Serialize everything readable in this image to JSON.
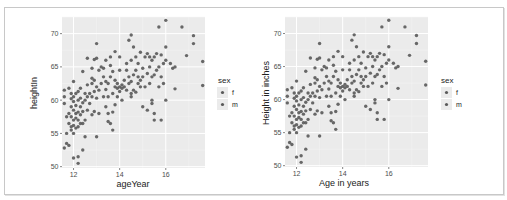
{
  "chart_data": [
    {
      "type": "scatter",
      "title": "",
      "xlabel": "ageYear",
      "ylabel": "heightIn",
      "xlim": [
        11.5,
        17.7
      ],
      "ylim": [
        49.8,
        72.5
      ],
      "x_ticks": [
        12,
        14,
        16
      ],
      "y_ticks": [
        50,
        55,
        60,
        65,
        70
      ],
      "grid": true,
      "legend": {
        "title": "sex",
        "entries": [
          "f",
          "m"
        ],
        "position": "right"
      }
    },
    {
      "type": "scatter",
      "title": "",
      "xlabel": "Age in years",
      "ylabel": "Height in inches",
      "xlim": [
        11.5,
        17.7
      ],
      "ylim": [
        49.8,
        72.5
      ],
      "x_ticks": [
        12,
        14,
        16
      ],
      "y_ticks": [
        50,
        55,
        60,
        65,
        70
      ],
      "grid": true,
      "legend": {
        "title": "sex",
        "entries": [
          "f",
          "m"
        ],
        "position": "right"
      }
    }
  ],
  "points": [
    [
      11.6,
      52.8
    ],
    [
      11.7,
      55
    ],
    [
      11.7,
      57.5
    ],
    [
      11.6,
      59.5
    ],
    [
      11.6,
      60.5
    ],
    [
      11.6,
      61.5
    ],
    [
      11.7,
      53.5
    ],
    [
      11.8,
      53.2
    ],
    [
      11.8,
      56.5
    ],
    [
      11.8,
      58
    ],
    [
      11.8,
      61.8
    ],
    [
      11.9,
      55.5
    ],
    [
      11.9,
      56
    ],
    [
      11.9,
      57.5
    ],
    [
      11.9,
      59
    ],
    [
      11.9,
      60.2
    ],
    [
      11.9,
      61
    ],
    [
      12,
      51.3
    ],
    [
      12,
      55
    ],
    [
      12,
      56.2
    ],
    [
      12,
      57
    ],
    [
      12,
      58.5
    ],
    [
      12,
      59.8
    ],
    [
      12,
      60.5
    ],
    [
      12,
      62.8
    ],
    [
      12.1,
      55.8
    ],
    [
      12.1,
      57.3
    ],
    [
      12.1,
      58
    ],
    [
      12.1,
      59.2
    ],
    [
      12.1,
      61
    ],
    [
      12.2,
      50.5
    ],
    [
      12.2,
      51.5
    ],
    [
      12.2,
      56
    ],
    [
      12.2,
      57
    ],
    [
      12.2,
      58.2
    ],
    [
      12.2,
      60
    ],
    [
      12.2,
      61.3
    ],
    [
      12.3,
      56.5
    ],
    [
      12.3,
      57.8
    ],
    [
      12.3,
      59
    ],
    [
      12.3,
      60.3
    ],
    [
      12.3,
      61.8
    ],
    [
      12.4,
      52.5
    ],
    [
      12.4,
      56.5
    ],
    [
      12.4,
      58.3
    ],
    [
      12.4,
      59.6
    ],
    [
      12.4,
      64.3
    ],
    [
      12.5,
      54.5
    ],
    [
      12.5,
      57
    ],
    [
      12.5,
      60
    ],
    [
      12.5,
      61
    ],
    [
      12.6,
      58.5
    ],
    [
      12.6,
      60.5
    ],
    [
      12.6,
      62.3
    ],
    [
      12.6,
      66.3
    ],
    [
      12.7,
      59.5
    ],
    [
      12.7,
      61
    ],
    [
      12.8,
      57.8
    ],
    [
      12.8,
      60.5
    ],
    [
      12.8,
      62.5
    ],
    [
      12.8,
      63.3
    ],
    [
      12.8,
      64.8
    ],
    [
      12.9,
      58.3
    ],
    [
      12.9,
      61.3
    ],
    [
      12.9,
      63
    ],
    [
      12.9,
      66.1
    ],
    [
      13,
      54.5
    ],
    [
      13,
      60.3
    ],
    [
      13,
      62
    ],
    [
      13,
      66.3
    ],
    [
      13,
      68.5
    ],
    [
      13.1,
      58
    ],
    [
      13.1,
      61.5
    ],
    [
      13.1,
      64.5
    ],
    [
      13.2,
      62.5
    ],
    [
      13.2,
      65
    ],
    [
      13.3,
      60.5
    ],
    [
      13.3,
      63.5
    ],
    [
      13.3,
      64.8
    ],
    [
      13.4,
      59
    ],
    [
      13.4,
      61.6
    ],
    [
      13.4,
      62.8
    ],
    [
      13.4,
      66
    ],
    [
      13.5,
      56.8
    ],
    [
      13.5,
      58
    ],
    [
      13.5,
      60.5
    ],
    [
      13.5,
      62.5
    ],
    [
      13.6,
      56.5
    ],
    [
      13.6,
      63.5
    ],
    [
      13.6,
      65.2
    ],
    [
      13.6,
      66.5
    ],
    [
      13.7,
      55.5
    ],
    [
      13.7,
      58.2
    ],
    [
      13.7,
      61
    ],
    [
      13.7,
      64.3
    ],
    [
      13.8,
      59.3
    ],
    [
      13.8,
      62
    ],
    [
      13.8,
      63
    ],
    [
      13.8,
      67.3
    ],
    [
      13.9,
      60.5
    ],
    [
      13.9,
      61.8
    ],
    [
      13.9,
      62.5
    ],
    [
      14,
      61.3
    ],
    [
      14,
      62
    ],
    [
      14,
      64.5
    ],
    [
      14,
      66.5
    ],
    [
      14.1,
      60
    ],
    [
      14.1,
      61.8
    ],
    [
      14.1,
      62.3
    ],
    [
      14.2,
      62
    ],
    [
      14.2,
      63
    ],
    [
      14.3,
      61.5
    ],
    [
      14.3,
      64.5
    ],
    [
      14.3,
      65.5
    ],
    [
      14.4,
      62.5
    ],
    [
      14.4,
      63.5
    ],
    [
      14.4,
      69
    ],
    [
      14.5,
      60.5
    ],
    [
      14.5,
      61
    ],
    [
      14.5,
      62.8
    ],
    [
      14.5,
      66
    ],
    [
      14.5,
      69.8
    ],
    [
      14.6,
      61.5
    ],
    [
      14.6,
      63.8
    ],
    [
      14.6,
      68
    ],
    [
      14.7,
      61.2
    ],
    [
      14.7,
      64.5
    ],
    [
      14.7,
      66.5
    ],
    [
      14.8,
      62.5
    ],
    [
      14.8,
      63.5
    ],
    [
      14.8,
      65.5
    ],
    [
      14.9,
      62
    ],
    [
      14.9,
      63
    ],
    [
      14.9,
      67.2
    ],
    [
      15,
      59
    ],
    [
      15,
      63.5
    ],
    [
      15,
      64.8
    ],
    [
      15.1,
      62
    ],
    [
      15.1,
      66.5
    ],
    [
      15.2,
      58.5
    ],
    [
      15.2,
      64
    ],
    [
      15.2,
      67
    ],
    [
      15.3,
      62.5
    ],
    [
      15.3,
      65
    ],
    [
      15.3,
      66.5
    ],
    [
      15.4,
      59.5
    ],
    [
      15.4,
      60
    ],
    [
      15.4,
      63.5
    ],
    [
      15.4,
      66
    ],
    [
      15.5,
      57
    ],
    [
      15.5,
      58
    ],
    [
      15.5,
      63.8
    ],
    [
      15.5,
      66.5
    ],
    [
      15.6,
      64.5
    ],
    [
      15.6,
      67
    ],
    [
      15.7,
      62
    ],
    [
      15.7,
      65
    ],
    [
      15.7,
      71
    ],
    [
      15.8,
      57
    ],
    [
      15.8,
      63.5
    ],
    [
      15.8,
      66.8
    ],
    [
      15.9,
      62.5
    ],
    [
      15.9,
      65.5
    ],
    [
      16,
      60
    ],
    [
      16,
      66
    ],
    [
      16,
      68
    ],
    [
      16,
      72
    ],
    [
      16.2,
      65.5
    ],
    [
      16.3,
      64.8
    ],
    [
      16.4,
      61.7
    ],
    [
      16.4,
      65
    ],
    [
      16.7,
      71
    ],
    [
      16.9,
      66.7
    ],
    [
      17.2,
      68.5
    ],
    [
      17.2,
      69.7
    ],
    [
      17.6,
      62.2
    ],
    [
      17.6,
      65.8
    ]
  ],
  "legend": {
    "title": "sex",
    "items": [
      {
        "label": "f"
      },
      {
        "label": "m"
      }
    ]
  },
  "colors": {
    "panel": "#ebebeb",
    "grid_major": "#ffffff",
    "point": "#595959",
    "border": "#c8c8c8"
  }
}
